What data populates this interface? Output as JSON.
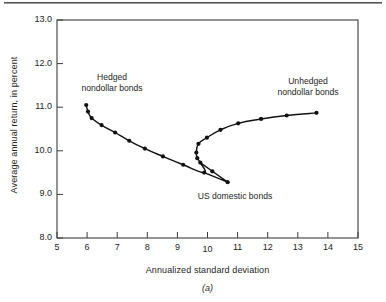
{
  "figure": {
    "panel_id": "(a)",
    "top_rule": "page-rule"
  },
  "axes": {
    "ylabel": "Average annual return, in percent",
    "xlabel": "Annualized standard deviation",
    "y_ticks": [
      "13.0",
      "12.0",
      "11.0",
      "10.0",
      "9.0",
      "8.0"
    ],
    "x_ticks": [
      "5",
      "6",
      "7",
      "8",
      "9",
      "10",
      "11",
      "12",
      "13",
      "14",
      "15"
    ]
  },
  "annotations": {
    "hedged": "Hedged\nnondollar bonds",
    "hedged_line1": "Hedged",
    "hedged_line2": "nondollar bonds",
    "unhedged_line1": "Unhedged",
    "unhedged_line2": "nondollar bonds",
    "us_domestic": "US domestic bonds"
  },
  "colors": {
    "axis": "#3c3c3c",
    "curve": "#111111",
    "marker": "#111111",
    "background": "#ffffff"
  },
  "chart_data": {
    "type": "line",
    "title": "",
    "subtitle": "",
    "xlabel": "Annualized standard deviation",
    "ylabel": "Average annual return, in percent",
    "xlim": [
      5,
      15
    ],
    "ylim": [
      8.0,
      13.0
    ],
    "xticks": [
      5,
      6,
      7,
      8,
      9,
      10,
      11,
      12,
      13,
      14,
      15
    ],
    "yticks": [
      8.0,
      9.0,
      10.0,
      11.0,
      12.0,
      13.0
    ],
    "grid": false,
    "legend": "none",
    "annotations": [
      {
        "text": "Hedged nondollar bonds",
        "x": 6.6,
        "y": 11.75,
        "points_to": [
          5.97,
          11.05
        ]
      },
      {
        "text": "Unhedged nondollar bonds",
        "x": 12.4,
        "y": 11.68,
        "points_to": [
          13.62,
          10.87
        ]
      },
      {
        "text": "US domestic bonds",
        "x": 11.3,
        "y": 8.85,
        "points_to": [
          10.67,
          9.28
        ]
      }
    ],
    "series": [
      {
        "name": "Efficient frontier (hedged to unhedged nondollar bonds)",
        "marker": "filled-circle",
        "points": [
          [
            5.97,
            11.05
          ],
          [
            6.03,
            10.9
          ],
          [
            6.15,
            10.75
          ],
          [
            6.48,
            10.59
          ],
          [
            6.93,
            10.42
          ],
          [
            7.4,
            10.23
          ],
          [
            7.92,
            10.05
          ],
          [
            8.52,
            9.87
          ],
          [
            9.19,
            9.68
          ],
          [
            9.89,
            9.5
          ],
          [
            10.16,
            9.53
          ],
          [
            10.67,
            9.28
          ],
          [
            9.76,
            9.73
          ],
          [
            9.66,
            9.83
          ],
          [
            9.63,
            9.96
          ],
          [
            9.7,
            10.16
          ],
          [
            9.98,
            10.3
          ],
          [
            10.43,
            10.48
          ],
          [
            11.02,
            10.63
          ],
          [
            11.78,
            10.73
          ],
          [
            12.63,
            10.81
          ],
          [
            13.62,
            10.87
          ]
        ]
      }
    ],
    "path_order": "Starts upper-left at (5.97, 11.05), descends to the right, bends back at a minimum-risk vertex near (9.63, 9.96), then rises to the right ending at (13.62, 10.87); a separate lower branch runs from (9.89, 9.50) through (10.16, 9.53) to (10.67, 9.28)."
  }
}
